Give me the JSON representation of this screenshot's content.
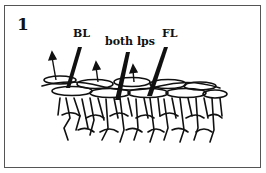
{
  "figure": {
    "number": "1",
    "labels": {
      "back_loop": "BL",
      "both_loops": "both lps",
      "front_loop": "FL"
    },
    "colors": {
      "ink": "#111111",
      "border": "#555555",
      "background": "#ffffff"
    }
  }
}
